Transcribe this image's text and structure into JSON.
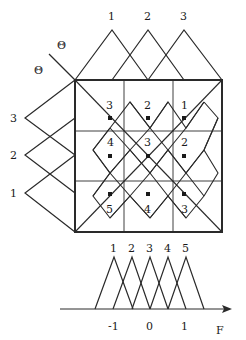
{
  "diagram": {
    "title": "",
    "theta_labels": [
      "Θ",
      "Θ"
    ],
    "top_membership": {
      "labels": [
        "1",
        "2",
        "3"
      ]
    },
    "left_membership": {
      "labels": [
        "3",
        "2",
        "1"
      ]
    },
    "grid": {
      "rows": [
        [
          "3",
          "2",
          "1"
        ],
        [
          "4",
          "3",
          "2"
        ],
        [
          "5",
          "4",
          "3"
        ]
      ]
    },
    "bottom_membership": {
      "labels": [
        "1",
        "2",
        "3",
        "4",
        "5"
      ],
      "axis_ticks": [
        "-1",
        "0",
        "1"
      ],
      "axis_label": "F"
    },
    "colors": {
      "line": "#2a2a2a",
      "background": "#ffffff"
    }
  }
}
